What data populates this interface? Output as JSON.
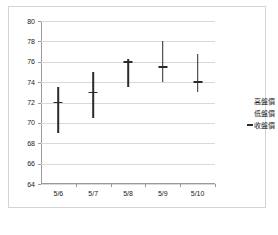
{
  "chart_data": {
    "type": "bar",
    "subtype": "high-low-close",
    "title": "",
    "xlabel": "",
    "ylabel": "",
    "categories": [
      "5/6",
      "5/7",
      "5/8",
      "5/9",
      "5/10"
    ],
    "ylim": [
      64,
      80
    ],
    "y_ticks": [
      64,
      66,
      68,
      70,
      72,
      74,
      76,
      78,
      80
    ],
    "y_tick_labels": [
      "64",
      "66",
      "68",
      "70",
      "72",
      "74",
      "76",
      "78",
      "80"
    ],
    "grid": true,
    "legend_position": "right",
    "series": [
      {
        "name": "高盤價",
        "values": [
          73.5,
          75.0,
          76.3,
          78.0,
          76.8
        ]
      },
      {
        "name": "低盤價",
        "values": [
          69.0,
          70.5,
          73.5,
          74.0,
          73.0
        ]
      },
      {
        "name": "收盤價",
        "values": [
          72.0,
          73.0,
          76.0,
          75.5,
          74.0
        ]
      }
    ],
    "colors": {
      "bar": "#2b2b2b",
      "gridline": "#d9d9d9",
      "axis": "#9a9a9a",
      "border": "#d4d4d4",
      "text": "#1a1a1a"
    }
  },
  "legend": {
    "items": [
      {
        "label": "高盤價",
        "marker": "none"
      },
      {
        "label": "低盤價",
        "marker": "none"
      },
      {
        "label": "收盤價",
        "marker": "dash"
      }
    ]
  }
}
